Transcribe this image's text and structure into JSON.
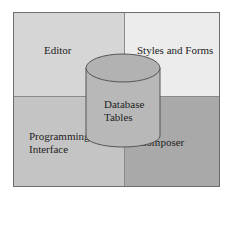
{
  "diagram": {
    "quadrants": [
      {
        "id": "top-left",
        "label": "Editor",
        "color": "#d6d6d6"
      },
      {
        "id": "top-right",
        "label": "Styles and Forms",
        "color": "#ececec"
      },
      {
        "id": "bottom-left",
        "label_line1": "Programming",
        "label_line2": "Interface",
        "color": "#c4c4c4"
      },
      {
        "id": "bottom-right",
        "label": "Composer",
        "color": "#a9a9a9"
      }
    ],
    "center": {
      "shape": "cylinder",
      "label_line1": "Database",
      "label_line2": "Tables",
      "fill": "#b8b8b8",
      "stroke": "#555555"
    }
  }
}
